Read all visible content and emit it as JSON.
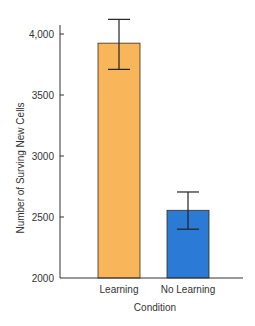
{
  "chart_data": {
    "type": "bar",
    "title": "",
    "xlabel": "Condition",
    "ylabel": "Number of Surving New Cells",
    "categories": [
      "Learning",
      "No Learning"
    ],
    "values": [
      3925,
      2555
    ],
    "error_bars": [
      {
        "upper": 4120,
        "lower": 3710
      },
      {
        "upper": 2705,
        "lower": 2400
      }
    ],
    "colors": [
      "#F9B55A",
      "#2A7AD6"
    ],
    "ylim": [
      2000,
      4050
    ],
    "yticks": [
      2000,
      2500,
      3000,
      3500,
      4000
    ],
    "ytick_labels": [
      "2000",
      "2500",
      "3000",
      "3500",
      "4,000"
    ],
    "grid": false,
    "legend": "none"
  }
}
